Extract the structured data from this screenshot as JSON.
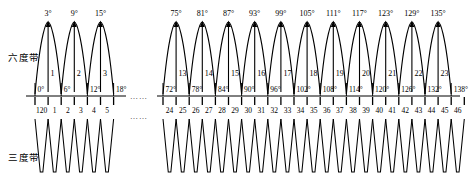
{
  "figure": {
    "type": "diagram",
    "rows": [
      {
        "label": "六度带",
        "name": "six-degree-zone-row"
      },
      {
        "label": "三度带",
        "name": "three-degree-zone-row"
      }
    ],
    "ellipsis": "……"
  },
  "six_degree": {
    "left_group": {
      "central_meridians": [
        "3°",
        "9°",
        "15°"
      ],
      "zone_numbers": [
        "1",
        "2",
        "3"
      ],
      "boundaries": [
        "0°",
        "6°",
        "12°",
        "18°"
      ]
    },
    "right_group": {
      "central_meridians": [
        "75°",
        "81°",
        "87°",
        "93°",
        "99°",
        "105°",
        "111°",
        "117°",
        "123°",
        "129°",
        "135°"
      ],
      "zone_numbers": [
        "13",
        "14",
        "15",
        "16",
        "17",
        "18",
        "19",
        "20",
        "21",
        "22",
        "23"
      ],
      "boundaries": [
        "72°",
        "78°",
        "84°",
        "90°",
        "96°",
        "102°",
        "108°",
        "114°",
        "120°",
        "126°",
        "132°",
        "138°"
      ]
    }
  },
  "three_degree": {
    "left_group": {
      "zone_numbers": [
        "120",
        "1",
        "2",
        "3",
        "4",
        "5"
      ]
    },
    "right_group": {
      "zone_numbers": [
        "24",
        "25",
        "26",
        "27",
        "28",
        "29",
        "30",
        "31",
        "32",
        "33",
        "34",
        "35",
        "36",
        "37",
        "38",
        "39",
        "40",
        "41",
        "42",
        "43",
        "44",
        "45",
        "46"
      ]
    }
  },
  "colors": {
    "ink": "#000000",
    "background": "#ffffff"
  }
}
